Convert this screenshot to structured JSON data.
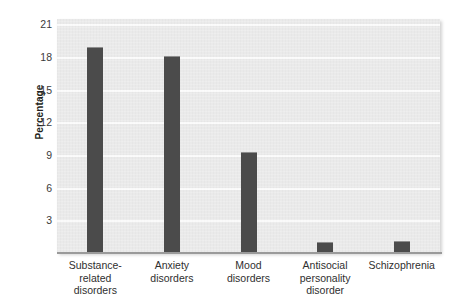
{
  "chart_data": {
    "type": "bar",
    "title": "",
    "subtitle": "",
    "xlabel": "",
    "ylabel": "Percentage",
    "categories": [
      "Substance-related disorders",
      "Anxiety disorders",
      "Mood disorders",
      "Antisocial personality disorder",
      "Schizophrenia"
    ],
    "category_lines": [
      [
        "Substance-",
        "related",
        "disorders"
      ],
      [
        "Anxiety",
        "disorders"
      ],
      [
        "Mood",
        "disorders"
      ],
      [
        "Antisocial",
        "personality",
        "disorder"
      ],
      [
        "Schizophrenia"
      ]
    ],
    "values": [
      18.9,
      18.1,
      9.3,
      1.0,
      1.1
    ],
    "ylim": [
      0,
      21.5
    ],
    "yticks": [
      3,
      6,
      9,
      12,
      15,
      18,
      21
    ],
    "ytick_labels": [
      "3",
      "6",
      "9",
      "12",
      "15",
      "18",
      "21"
    ],
    "grid": "horizontal",
    "legend": "none",
    "bar_color": "#4b4b4b",
    "plot_background": "#e9e9e9",
    "gridline_color": "#fbfbfb",
    "axis_color": "#9a9a9a"
  }
}
